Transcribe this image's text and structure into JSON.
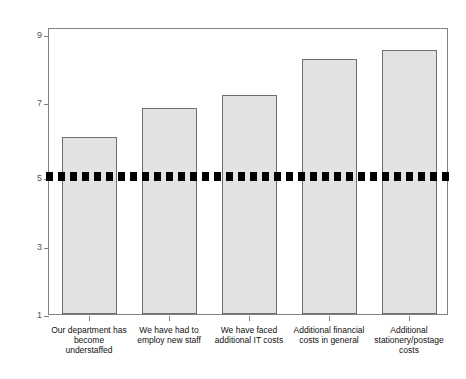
{
  "chart_data": {
    "type": "bar",
    "title": "",
    "xlabel": "",
    "ylabel": "Mean (1 = disagree, 9 = agree)",
    "ylim": [
      1,
      9.2
    ],
    "yticks": [
      9,
      7,
      5,
      3,
      1
    ],
    "ytick_labels": [
      "9",
      "7",
      "5",
      "3",
      "1"
    ],
    "grid": false,
    "legend": null,
    "categories": [
      "Our department has become understaffed",
      "We have had to employ new staff",
      "We have faced additional IT costs",
      "Additional financial costs in general",
      "Additional stationery/postage costs"
    ],
    "category_lines": [
      [
        "Our department has",
        "become",
        "understaffed"
      ],
      [
        "We have had to",
        "employ new staff"
      ],
      [
        "We have faced",
        "additional IT costs"
      ],
      [
        "Additional financial",
        "costs in general"
      ],
      [
        "Additional",
        "stationery/postage",
        "costs"
      ]
    ],
    "values": [
      6.05,
      6.88,
      7.25,
      8.3,
      8.55
    ],
    "bar_color": "#e2e2e2",
    "bar_edge_color": "#6e6e6e",
    "reference_line": {
      "value": 5,
      "style": "dashed",
      "color": "#000000",
      "width_px": 9
    }
  },
  "caption": ""
}
